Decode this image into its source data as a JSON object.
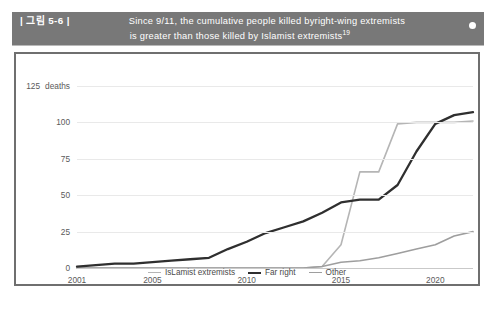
{
  "header": {
    "figure_tag": "| 그림 5-6 |",
    "line1": "Since 9/11, the cumulative people killed byright-wing extremists",
    "line2": "is greater than those killed by Islamist extremists",
    "footnote": "19",
    "bullet_icon": "bullet-dot-icon",
    "bar_color": "#787878"
  },
  "chart_data": {
    "type": "line",
    "title": "",
    "subtitle": "",
    "xlabel": "",
    "ylabel": "deaths",
    "unit_label": "deaths",
    "grid": true,
    "legend_position": "bottom",
    "xlim": [
      2001,
      2022
    ],
    "ylim": [
      0,
      125
    ],
    "ytick_labels": [
      "0",
      "25",
      "50",
      "75",
      "100",
      "125"
    ],
    "yticks": [
      0,
      25,
      50,
      75,
      100,
      125
    ],
    "xtick_labels": [
      "2001",
      "2005",
      "2010",
      "2015",
      "2020"
    ],
    "xticks": [
      2001,
      2005,
      2010,
      2015,
      2020
    ],
    "x": [
      2001,
      2002,
      2003,
      2004,
      2005,
      2006,
      2007,
      2008,
      2009,
      2010,
      2011,
      2012,
      2013,
      2014,
      2015,
      2016,
      2017,
      2018,
      2019,
      2020,
      2021,
      2022
    ],
    "series": [
      {
        "name": "IsLamist extremists",
        "color": "#b5b5b5",
        "width": 1.6,
        "values": [
          0,
          0,
          0,
          0,
          0,
          0,
          0,
          0,
          0,
          0,
          0,
          0,
          0,
          1,
          16,
          66,
          66,
          99,
          100,
          100,
          100,
          101
        ]
      },
      {
        "name": "Far right",
        "color": "#2f2f2f",
        "width": 2.3,
        "values": [
          1,
          2,
          3,
          3,
          4,
          5,
          6,
          7,
          13,
          18,
          24,
          28,
          32,
          38,
          45,
          47,
          47,
          57,
          80,
          99,
          105,
          107
        ]
      },
      {
        "name": "Other",
        "color": "#9e9e9e",
        "width": 1.6,
        "values": [
          0,
          0,
          0,
          0,
          0,
          0,
          0,
          0,
          0,
          0,
          0,
          0,
          0,
          1,
          4,
          5,
          7,
          10,
          13,
          16,
          22,
          25
        ]
      }
    ]
  },
  "legend": [
    {
      "label": "IsLamist extremists",
      "color": "#b5b5b5",
      "width": 1.6
    },
    {
      "label": "Far right",
      "color": "#2f2f2f",
      "width": 2.6
    },
    {
      "label": "Other",
      "color": "#9e9e9e",
      "width": 1.6
    }
  ]
}
